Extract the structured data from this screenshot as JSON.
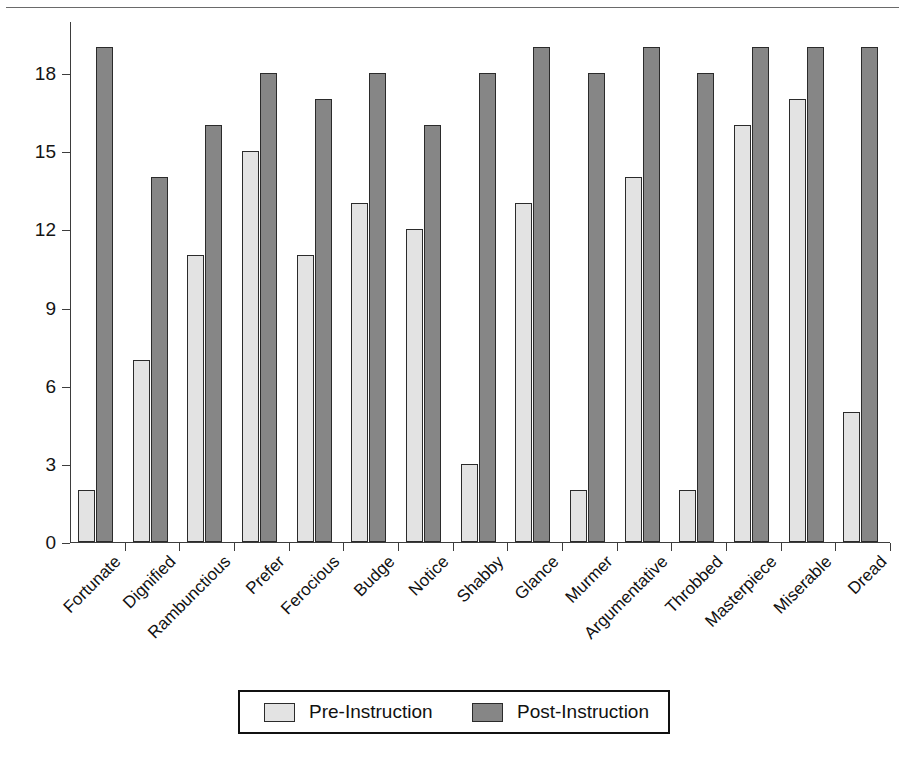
{
  "figure": {
    "title_partial": "",
    "background": "#ffffff",
    "rule_color": "#6a6a6a"
  },
  "chart_data": {
    "type": "bar",
    "title": "",
    "xlabel": "",
    "ylabel": "",
    "ylim": [
      0,
      20
    ],
    "yticks": [
      0,
      3,
      6,
      9,
      12,
      15,
      18
    ],
    "ytick_labels": [
      "0",
      "3",
      "6",
      "9",
      "12",
      "15",
      "18"
    ],
    "grid": false,
    "legend_position": "bottom",
    "categories": [
      "Fortunate",
      "Dignified",
      "Rambunctious",
      "Prefer",
      "Ferocious",
      "Budge",
      "Notice",
      "Shabby",
      "Glance",
      "Murmer",
      "Argumentative",
      "Throbbed",
      "Masterpiece",
      "Miserable",
      "Dread"
    ],
    "series": [
      {
        "name": "Pre-Instruction",
        "color": "#e3e3e3",
        "values": [
          2,
          7,
          11,
          15,
          11,
          13,
          12,
          3,
          13,
          2,
          14,
          2,
          16,
          17,
          5
        ]
      },
      {
        "name": "Post-Instruction",
        "color": "#868686",
        "values": [
          19,
          14,
          16,
          18,
          17,
          18,
          16,
          18,
          19,
          18,
          19,
          18,
          19,
          19,
          19
        ]
      }
    ]
  },
  "legend": {
    "entries": [
      {
        "label": "Pre-Instruction",
        "swatch": "pre"
      },
      {
        "label": "Post-Instruction",
        "swatch": "post"
      }
    ]
  }
}
